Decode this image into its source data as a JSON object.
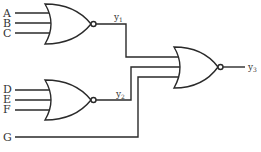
{
  "diagram": {
    "type": "logic-circuit",
    "inputs": {
      "a": "A",
      "b": "B",
      "c": "C",
      "d": "D",
      "e": "E",
      "f": "F",
      "g": "G"
    },
    "gates": [
      {
        "id": "gate1",
        "kind": "NOR",
        "inputs": [
          "A",
          "B",
          "C"
        ],
        "output": "y1"
      },
      {
        "id": "gate2",
        "kind": "NOR",
        "inputs": [
          "D",
          "E",
          "F"
        ],
        "output": "y2"
      },
      {
        "id": "gate3",
        "kind": "NOR",
        "inputs": [
          "y1",
          "y2",
          "G"
        ],
        "output": "y3"
      }
    ],
    "outputs": {
      "y1": {
        "base": "y",
        "sub": "1"
      },
      "y2": {
        "base": "y",
        "sub": "2"
      },
      "y3": {
        "base": "y",
        "sub": "3"
      }
    }
  }
}
